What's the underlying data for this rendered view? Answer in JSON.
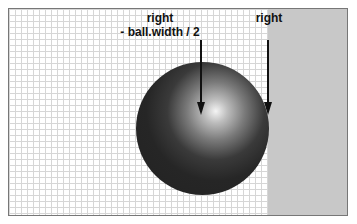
{
  "diagram": {
    "labels": {
      "left_line1": "right",
      "left_line2": "- ball.width / 2",
      "right": "right"
    },
    "colors": {
      "wall": "#c8c8c8",
      "grid": "#d6d6d6",
      "ball_dark": "#222222",
      "ball_highlight": "#f4f4f4",
      "arrow": "#111111"
    }
  }
}
